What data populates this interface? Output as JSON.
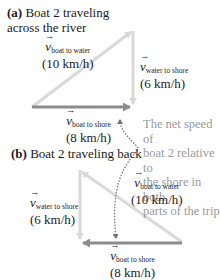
{
  "part_a": {
    "letter": "(a)",
    "title_line1": " Boat 2 traveling",
    "title_line2": "across the river",
    "vectors": {
      "boat_to_water": {
        "symbol": "v",
        "subscript": "boat to water",
        "value": "(10 km/h)"
      },
      "water_to_shore": {
        "symbol": "v",
        "subscript": "water to shore",
        "value": "(6 km/h)"
      },
      "boat_to_shore": {
        "symbol": "v",
        "subscript": "boat to shore",
        "value": "(8 km/h)"
      }
    }
  },
  "part_b": {
    "letter": "(b)",
    "title": " Boat 2 traveling back",
    "vectors": {
      "water_to_shore": {
        "symbol": "v",
        "subscript": "water to shore",
        "value": "(6 km/h)"
      },
      "boat_to_water": {
        "symbol": "v",
        "subscript": "boat to water",
        "value": "(10 km/h)"
      },
      "boat_to_shore": {
        "symbol": "v",
        "subscript": "boat to shore",
        "value": "(8 km/h)"
      }
    }
  },
  "annotation": {
    "lines": [
      "The net speed of",
      "boat 2 relative to",
      "the shore in both",
      "parts of the trip"
    ]
  },
  "colors": {
    "light_vector": "#d9d9d9",
    "dark_vector": "#8c8c8c",
    "annotation_text": "#9a9a9a",
    "dotted_arrow": "#707070"
  }
}
